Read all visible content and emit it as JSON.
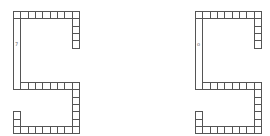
{
  "diagram": {
    "colors": {
      "line": "#555555",
      "background": "#ffffff",
      "glyph": "#666666"
    },
    "cell_size": 7.33,
    "figures": [
      {
        "id": "left",
        "offset_x": 13,
        "glyph": "7"
      },
      {
        "id": "right",
        "offset_x": 195,
        "glyph": "o"
      }
    ],
    "segments": {
      "top_row": {
        "cells": 9
      },
      "top_right_column": {
        "cells": 4
      },
      "left_long_bar": {
        "cells": 1
      },
      "middle_row": {
        "cells": 8
      },
      "lower_right_column": {
        "cells": 5
      },
      "bottom_row": {
        "cells": 9
      },
      "bottom_left_column": {
        "cells": 2
      }
    }
  }
}
